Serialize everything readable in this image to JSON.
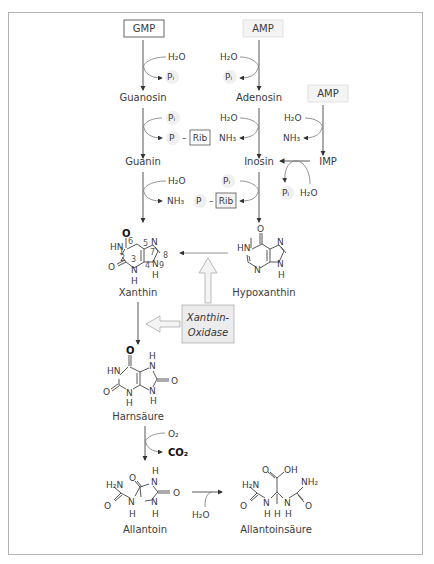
{
  "diagram": {
    "nodes": {
      "gmp": "GMP",
      "amp_top": "AMP",
      "amp_right": "AMP",
      "guanosin": "Guanosin",
      "adenosin": "Adenosin",
      "guanin": "Guanin",
      "inosin": "Inosin",
      "imp": "IMP",
      "xanthin": "Xanthin",
      "hypoxanthin": "Hypoxanthin",
      "harnsaeure": "Harnsäure",
      "allantoin": "Allantoin",
      "allantoinsaeure": "Allantoinsäure"
    },
    "enzyme": {
      "line1": "Xanthin-",
      "line2": "Oxidase"
    },
    "reagents": {
      "h2o": "H₂O",
      "pi": "Pᵢ",
      "nh3": "NH₃",
      "p": "P",
      "rib": "Rib",
      "dash": "–",
      "o2": "O₂",
      "co2": "CO₂"
    },
    "atoms": {
      "O": "O",
      "N": "N",
      "H": "H",
      "HN": "HN",
      "C": "C",
      "OH": "OH",
      "H2N": "H₂N",
      "NH2": "NH₂"
    },
    "xanthin_numbering": [
      "1",
      "2",
      "3",
      "4",
      "5",
      "6",
      "7",
      "8",
      "9"
    ]
  }
}
